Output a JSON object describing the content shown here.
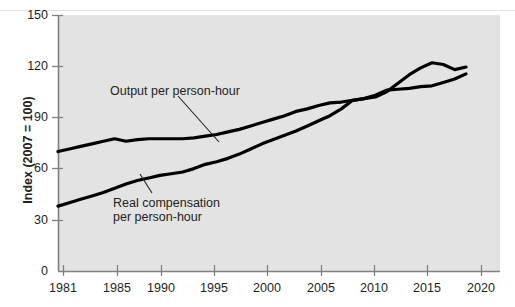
{
  "chart_data": {
    "type": "line",
    "title": "",
    "subtitle": "",
    "xlabel": "",
    "ylabel": "Index (2007 = 100)",
    "xlim": [
      1981,
      2020
    ],
    "ylim": [
      0,
      150
    ],
    "xticks": [
      1981,
      1985,
      1990,
      1995,
      2000,
      2005,
      2010,
      2015,
      2020
    ],
    "xtick_labels": [
      "1981",
      "1985",
      "1990",
      "1995",
      "2000",
      "2005",
      "2010",
      "2015",
      "2020"
    ],
    "yticks": [
      0,
      30,
      60,
      90,
      120,
      150
    ],
    "ytick_labels": [
      "0",
      "30",
      "60",
      "90",
      "120",
      "150"
    ],
    "grid": false,
    "legend_position": "inline-annotations",
    "plot_background": "#e3e3e3",
    "line_color": "#000000",
    "axis_color": "#808080",
    "x": [
      1981,
      1982,
      1983,
      1984,
      1985,
      1986,
      1987,
      1988,
      1989,
      1990,
      1991,
      1992,
      1993,
      1994,
      1995,
      1996,
      1997,
      1998,
      1999,
      2000,
      2001,
      2002,
      2003,
      2004,
      2005,
      2006,
      2007,
      2008,
      2009,
      2010,
      2011,
      2012,
      2013,
      2014,
      2015,
      2016,
      2017
    ],
    "series": [
      {
        "name": "Output per person-hour",
        "label": "Output per person-hour",
        "values": [
          70,
          71.5,
          73,
          74.5,
          76,
          77.5,
          76,
          77,
          77.5,
          77.5,
          77.5,
          77.5,
          78,
          79,
          80,
          81.5,
          83,
          85,
          87,
          89,
          91,
          93.5,
          95,
          97,
          98.5,
          99,
          100,
          101,
          103,
          106,
          106.5,
          107,
          108,
          108.5,
          110.5,
          112.5,
          115.5
        ]
      },
      {
        "name": "Real compensation per person-hour",
        "label": "Real compensation per person-hour",
        "values": [
          38,
          40,
          42,
          44,
          46,
          48.5,
          51,
          53,
          54.5,
          56,
          57,
          58,
          60,
          62.5,
          64,
          66,
          68.5,
          71.5,
          74.5,
          77,
          79.5,
          82,
          85,
          88,
          91,
          95,
          100,
          101,
          102,
          105,
          110,
          115,
          119,
          122,
          121,
          118,
          119.5
        ]
      }
    ],
    "annotations": [
      {
        "id": "output-annotation",
        "text": "Output per person-hour",
        "text_x": 110,
        "text_y": 84,
        "leader_from": [
          178,
          96
        ],
        "leader_to": [
          219,
          142
        ]
      },
      {
        "id": "compensation-annotation",
        "text_line1": "Real compensation",
        "text_line2": "per person-hour",
        "text_x": 113,
        "text_y": 196,
        "leader_from": [
          152,
          193
        ],
        "leader_to": [
          140,
          174
        ]
      }
    ]
  }
}
